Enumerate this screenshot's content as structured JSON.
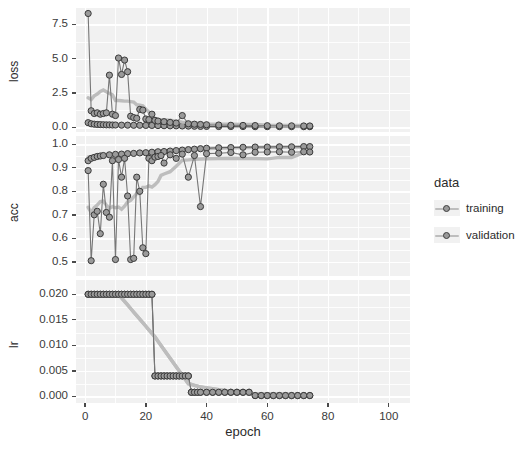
{
  "chart_data": {
    "type": "line",
    "title": "",
    "subtitle": "",
    "xlabel": "epoch",
    "ylabel": "",
    "grid": true,
    "legend_position": "right",
    "legend_title": "data",
    "facets": [
      {
        "name": "loss",
        "ylabel": "loss",
        "ylim": [
          -0.35,
          8.7
        ],
        "yticks": [
          0.0,
          2.5,
          5.0,
          7.5
        ],
        "ytick_labels": [
          "0.0",
          "2.5",
          "5.0",
          "7.5"
        ],
        "yminor": [
          1.25,
          3.75,
          6.25
        ],
        "series": [
          {
            "name": "training",
            "color": "#a9a9a9",
            "x": [
              1,
              2,
              3,
              4,
              5,
              6,
              7,
              8,
              9,
              10,
              12,
              14,
              16,
              18,
              20,
              22,
              24,
              26,
              28,
              30,
              32,
              34,
              36,
              38,
              40,
              44,
              48,
              52,
              56,
              60,
              64,
              68,
              72,
              74
            ],
            "values": [
              0.33,
              0.25,
              0.22,
              0.2,
              0.19,
              0.18,
              0.17,
              0.17,
              0.16,
              0.16,
              0.15,
              0.15,
              0.14,
              0.14,
              0.13,
              0.13,
              0.12,
              0.11,
              0.1,
              0.1,
              0.09,
              0.08,
              0.07,
              0.06,
              0.06,
              0.05,
              0.05,
              0.05,
              0.04,
              0.04,
              0.04,
              0.04,
              0.04,
              0.04
            ]
          },
          {
            "name": "validation",
            "color": "#8f8f8f",
            "x": [
              1,
              2,
              3,
              4,
              5,
              6,
              7,
              8,
              9,
              10,
              11,
              12,
              13,
              14,
              15,
              16,
              17,
              18,
              19,
              20,
              21,
              22,
              23,
              24,
              26,
              28,
              30,
              32,
              34,
              36,
              38,
              40,
              44,
              48,
              52,
              56,
              60,
              64,
              68,
              72,
              74
            ],
            "values": [
              8.3,
              1.2,
              1.0,
              1.05,
              0.95,
              1.0,
              1.05,
              3.8,
              0.95,
              0.85,
              5.05,
              3.85,
              4.9,
              4.05,
              0.8,
              0.7,
              0.65,
              1.3,
              1.25,
              0.6,
              0.55,
              0.95,
              0.5,
              0.45,
              0.4,
              0.35,
              0.3,
              0.85,
              0.25,
              0.22,
              0.2,
              0.18,
              0.16,
              0.14,
              0.13,
              0.12,
              0.11,
              0.1,
              0.1,
              0.09,
              0.09
            ]
          }
        ]
      },
      {
        "name": "acc",
        "ylabel": "acc",
        "ylim": [
          0.44,
          1.035
        ],
        "yticks": [
          0.5,
          0.6,
          0.7,
          0.8,
          0.9,
          1.0
        ],
        "ytick_labels": [
          "0.5",
          "0.6",
          "0.7",
          "0.8",
          "0.9",
          "1.0"
        ],
        "yminor": [
          0.55,
          0.65,
          0.75,
          0.85,
          0.95
        ],
        "series": [
          {
            "name": "training",
            "color": "#a9a9a9",
            "x": [
              1,
              2,
              3,
              4,
              5,
              6,
              8,
              10,
              12,
              14,
              16,
              18,
              20,
              22,
              24,
              26,
              28,
              30,
              32,
              34,
              36,
              38,
              40,
              44,
              48,
              52,
              56,
              60,
              64,
              68,
              72,
              74
            ],
            "values": [
              0.93,
              0.94,
              0.944,
              0.948,
              0.95,
              0.952,
              0.955,
              0.957,
              0.958,
              0.96,
              0.961,
              0.963,
              0.964,
              0.966,
              0.968,
              0.969,
              0.971,
              0.973,
              0.975,
              0.977,
              0.979,
              0.981,
              0.983,
              0.985,
              0.986,
              0.987,
              0.988,
              0.988,
              0.989,
              0.989,
              0.99,
              0.99
            ]
          },
          {
            "name": "validation",
            "color": "#8f8f8f",
            "x": [
              1,
              2,
              3,
              4,
              5,
              6,
              7,
              8,
              9,
              10,
              11,
              12,
              13,
              14,
              15,
              16,
              17,
              18,
              19,
              20,
              21,
              22,
              23,
              24,
              25,
              26,
              28,
              30,
              32,
              34,
              36,
              38,
              40,
              44,
              48,
              52,
              56,
              60,
              64,
              68,
              72,
              74
            ],
            "values": [
              0.888,
              0.505,
              0.7,
              0.715,
              0.62,
              0.83,
              0.71,
              0.69,
              0.93,
              0.51,
              0.935,
              0.86,
              0.94,
              0.78,
              0.51,
              0.515,
              0.86,
              0.8,
              0.56,
              0.535,
              0.94,
              0.93,
              0.945,
              0.948,
              0.952,
              0.92,
              0.955,
              0.94,
              0.958,
              0.86,
              0.952,
              0.735,
              0.96,
              0.962,
              0.965,
              0.955,
              0.966,
              0.967,
              0.968,
              0.966,
              0.968,
              0.967
            ]
          }
        ]
      },
      {
        "name": "lr",
        "ylabel": "lr",
        "ylim": [
          -0.0013,
          0.0228
        ],
        "yticks": [
          0.0,
          0.005,
          0.01,
          0.015,
          0.02
        ],
        "ytick_labels": [
          "0.000",
          "0.005",
          "0.010",
          "0.015",
          "0.020"
        ],
        "yminor": [
          0.0025,
          0.0075,
          0.0125,
          0.0175
        ],
        "series": [
          {
            "name": "training",
            "color": "#a9a9a9",
            "x": [
              1,
              2,
              3,
              4,
              5,
              6,
              7,
              8,
              9,
              10,
              11,
              12,
              13,
              14,
              15,
              16,
              17,
              18,
              19,
              20,
              21,
              22,
              23,
              24,
              25,
              26,
              27,
              28,
              29,
              30,
              31,
              32,
              33,
              34,
              35,
              36,
              37,
              38,
              40,
              42,
              44,
              46,
              48,
              50,
              52,
              54,
              56,
              58,
              60,
              62,
              64,
              66,
              68,
              70,
              72,
              74
            ],
            "values": [
              0.02,
              0.02,
              0.02,
              0.02,
              0.02,
              0.02,
              0.02,
              0.02,
              0.02,
              0.02,
              0.02,
              0.02,
              0.02,
              0.02,
              0.02,
              0.02,
              0.02,
              0.02,
              0.02,
              0.02,
              0.02,
              0.02,
              0.004,
              0.004,
              0.004,
              0.004,
              0.004,
              0.004,
              0.004,
              0.004,
              0.004,
              0.004,
              0.004,
              0.004,
              0.0008,
              0.0008,
              0.0008,
              0.0008,
              0.0008,
              0.0008,
              0.0008,
              0.0008,
              0.0008,
              0.0008,
              0.0008,
              0.0008,
              0.00016,
              0.00016,
              0.00016,
              0.00016,
              0.00016,
              0.00016,
              0.00016,
              0.00016,
              0.00016,
              0.00016
            ]
          },
          {
            "name": "validation",
            "color": "#8f8f8f",
            "x": [
              1,
              2,
              3,
              4,
              5,
              6,
              7,
              8,
              9,
              10,
              11,
              12,
              13,
              14,
              15,
              16,
              17,
              18,
              19,
              20,
              21,
              22,
              23,
              24,
              25,
              26,
              27,
              28,
              29,
              30,
              31,
              32,
              33,
              34,
              35,
              36,
              37,
              38,
              40,
              42,
              44,
              46,
              48,
              50,
              52,
              54,
              56,
              58,
              60,
              62,
              64,
              66,
              68,
              70,
              72,
              74
            ],
            "values": [
              0.02,
              0.02,
              0.02,
              0.02,
              0.02,
              0.02,
              0.02,
              0.02,
              0.02,
              0.02,
              0.02,
              0.02,
              0.02,
              0.02,
              0.02,
              0.02,
              0.02,
              0.02,
              0.02,
              0.02,
              0.02,
              0.02,
              0.004,
              0.004,
              0.004,
              0.004,
              0.004,
              0.004,
              0.004,
              0.004,
              0.004,
              0.004,
              0.004,
              0.004,
              0.0008,
              0.0008,
              0.0008,
              0.0008,
              0.0008,
              0.0008,
              0.0008,
              0.0008,
              0.0008,
              0.0008,
              0.0008,
              0.0008,
              0.00016,
              0.00016,
              0.00016,
              0.00016,
              0.00016,
              0.00016,
              0.00016,
              0.00016,
              0.00016,
              0.00016
            ]
          }
        ]
      }
    ],
    "xlim": [
      -3,
      107
    ],
    "xticks": [
      0,
      20,
      40,
      60,
      80,
      100
    ],
    "xtick_labels": [
      "0",
      "20",
      "40",
      "60",
      "80",
      "100"
    ],
    "xminor": [
      10,
      30,
      50,
      70,
      90
    ],
    "legend_entries": [
      {
        "label": "training",
        "color": "#a9a9a9"
      },
      {
        "label": "validation",
        "color": "#8f8f8f"
      }
    ]
  }
}
